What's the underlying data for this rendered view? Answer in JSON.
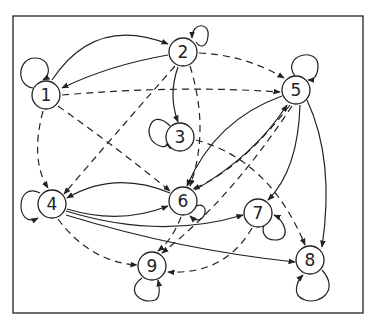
{
  "caption": "",
  "frame": {
    "x": 13,
    "y": 16,
    "width": 350,
    "height": 297
  },
  "colors": {
    "stroke": "#222222",
    "background": "#ffffff"
  },
  "nodes": [
    {
      "id": "1",
      "label": "1",
      "x": 46,
      "y": 95
    },
    {
      "id": "2",
      "label": "2",
      "x": 183,
      "y": 52
    },
    {
      "id": "3",
      "label": "3",
      "x": 180,
      "y": 137
    },
    {
      "id": "4",
      "label": "4",
      "x": 52,
      "y": 204
    },
    {
      "id": "5",
      "label": "5",
      "x": 296,
      "y": 90
    },
    {
      "id": "6",
      "label": "6",
      "x": 183,
      "y": 201
    },
    {
      "id": "7",
      "label": "7",
      "x": 258,
      "y": 213
    },
    {
      "id": "8",
      "label": "8",
      "x": 310,
      "y": 260
    },
    {
      "id": "9",
      "label": "9",
      "x": 152,
      "y": 266
    }
  ],
  "edges": [
    {
      "from": "1",
      "to": "2",
      "style": "solid"
    },
    {
      "from": "2",
      "to": "1",
      "style": "solid"
    },
    {
      "from": "2",
      "to": "3",
      "style": "solid"
    },
    {
      "from": "1",
      "to": "5",
      "style": "dashed"
    },
    {
      "from": "2",
      "to": "5",
      "style": "dashed"
    },
    {
      "from": "1",
      "to": "4",
      "style": "dashed"
    },
    {
      "from": "1",
      "to": "6",
      "style": "dashed"
    },
    {
      "from": "2",
      "to": "4",
      "style": "dashed"
    },
    {
      "from": "2",
      "to": "6",
      "style": "dashed"
    },
    {
      "from": "3",
      "to": "8",
      "style": "dashed"
    },
    {
      "from": "5",
      "to": "6",
      "style": "solid"
    },
    {
      "from": "6",
      "to": "5",
      "style": "solid"
    },
    {
      "from": "5",
      "to": "9",
      "style": "dashed"
    },
    {
      "from": "5",
      "to": "6",
      "style": "dashed"
    },
    {
      "from": "5",
      "to": "7",
      "style": "solid"
    },
    {
      "from": "5",
      "to": "8",
      "style": "solid"
    },
    {
      "from": "4",
      "to": "6",
      "style": "solid"
    },
    {
      "from": "6",
      "to": "4",
      "style": "solid"
    },
    {
      "from": "4",
      "to": "7",
      "style": "solid"
    },
    {
      "from": "4",
      "to": "8",
      "style": "solid"
    },
    {
      "from": "4",
      "to": "9",
      "style": "dashed"
    },
    {
      "from": "6",
      "to": "9",
      "style": "dashed"
    },
    {
      "from": "7",
      "to": "9",
      "style": "dashed"
    },
    {
      "from": "1",
      "to": "1",
      "style": "solid"
    },
    {
      "from": "2",
      "to": "2",
      "style": "solid"
    },
    {
      "from": "3",
      "to": "3",
      "style": "solid"
    },
    {
      "from": "4",
      "to": "4",
      "style": "solid"
    },
    {
      "from": "5",
      "to": "5",
      "style": "solid"
    },
    {
      "from": "6",
      "to": "6",
      "style": "solid"
    },
    {
      "from": "7",
      "to": "7",
      "style": "solid"
    },
    {
      "from": "8",
      "to": "8",
      "style": "solid"
    },
    {
      "from": "9",
      "to": "9",
      "style": "solid"
    }
  ]
}
